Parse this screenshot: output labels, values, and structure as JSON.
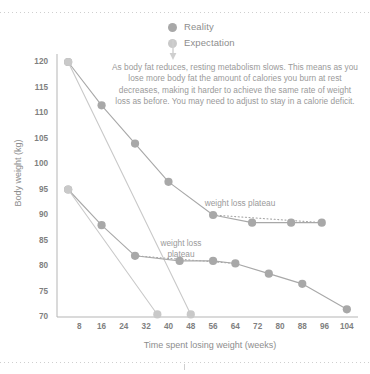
{
  "legend": {
    "items": [
      {
        "label": "Reality",
        "color": "#a8a8a8"
      },
      {
        "label": "Expectation",
        "color": "#c9c9c9"
      }
    ]
  },
  "annotation": {
    "text": "As body fat reduces, resting metabolism slows. This means as you lose more body fat the amount of calories you burn at rest decreases, making it harder to achieve the same rate of weight loss as before. You may need to adjust to stay in a calorie deficit."
  },
  "plot_labels": {
    "plateau_upper": "weight loss plateau",
    "plateau_lower": "weight loss plateau"
  },
  "chart_data": {
    "type": "line",
    "title": "",
    "xlabel": "Time spent losing weight (weeks)",
    "ylabel": "Body weight (kg)",
    "xlim": [
      0,
      108
    ],
    "ylim": [
      68,
      122
    ],
    "xticks": [
      8,
      16,
      24,
      32,
      40,
      48,
      56,
      64,
      72,
      80,
      88,
      96,
      104
    ],
    "yticks": [
      70,
      75,
      80,
      85,
      90,
      95,
      100,
      105,
      110,
      115,
      120
    ],
    "grid": false,
    "legend_position": "top-center",
    "colors": {
      "reality": "#a8a8a8",
      "expectation": "#c9c9c9",
      "axis": "#b5b5b5",
      "text": "#8d8d8d"
    },
    "series": [
      {
        "name": "Reality (start 120 kg)",
        "kind": "reality",
        "points": [
          {
            "x": 4,
            "y": 120
          },
          {
            "x": 16,
            "y": 111.5
          },
          {
            "x": 28,
            "y": 104
          },
          {
            "x": 40,
            "y": 96.5
          },
          {
            "x": 56,
            "y": 90
          },
          {
            "x": 70,
            "y": 88.5
          },
          {
            "x": 84,
            "y": 88.5
          },
          {
            "x": 95,
            "y": 88.5
          }
        ]
      },
      {
        "name": "Expectation (start 120 kg)",
        "kind": "expectation",
        "points": [
          {
            "x": 4,
            "y": 120
          },
          {
            "x": 48,
            "y": 70.5
          }
        ]
      },
      {
        "name": "Reality (start 95 kg)",
        "kind": "reality",
        "points": [
          {
            "x": 4,
            "y": 95
          },
          {
            "x": 16,
            "y": 88
          },
          {
            "x": 28,
            "y": 82
          },
          {
            "x": 44,
            "y": 81
          },
          {
            "x": 56,
            "y": 81
          },
          {
            "x": 64,
            "y": 80.5
          },
          {
            "x": 76,
            "y": 78.5
          },
          {
            "x": 88,
            "y": 76.5
          },
          {
            "x": 104,
            "y": 71.5
          }
        ]
      },
      {
        "name": "Expectation (start 95 kg)",
        "kind": "expectation",
        "points": [
          {
            "x": 4,
            "y": 95
          },
          {
            "x": 36,
            "y": 70.5
          }
        ]
      }
    ],
    "plateau_connectors": [
      {
        "from": {
          "x": 56,
          "y": 90
        },
        "to": {
          "x": 95,
          "y": 88.5
        }
      },
      {
        "from": {
          "x": 28,
          "y": 82
        },
        "to": {
          "x": 64,
          "y": 80.5
        }
      }
    ],
    "annotations": [
      {
        "text": "weight loss plateau",
        "x": 75,
        "y": 93
      },
      {
        "text": "weight loss plateau",
        "x": 45,
        "y": 85
      }
    ]
  }
}
